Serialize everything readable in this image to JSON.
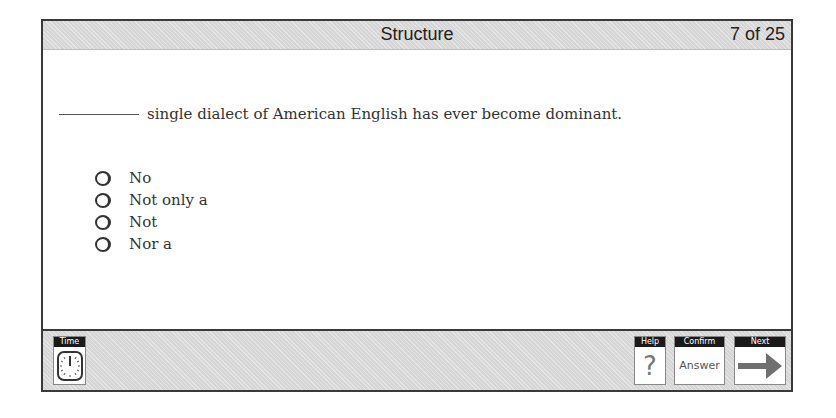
{
  "header": {
    "title": "Structure",
    "counter": "7 of 25"
  },
  "question": {
    "text": "single dialect of American English has ever become dominant."
  },
  "options": [
    {
      "label": "No"
    },
    {
      "label": "Not only a"
    },
    {
      "label": "Not"
    },
    {
      "label": "Nor a"
    }
  ],
  "toolbar": {
    "time_label": "Time",
    "help_label": "Help",
    "help_glyph": "?",
    "confirm_label": "Confirm",
    "confirm_body": "Answer",
    "next_label": "Next"
  },
  "colors": {
    "bar_gray": "#d6d6d6",
    "frame_border": "#3a3a3a",
    "label_black": "#1a1a1a",
    "arrow_gray": "#6f6f6f"
  }
}
